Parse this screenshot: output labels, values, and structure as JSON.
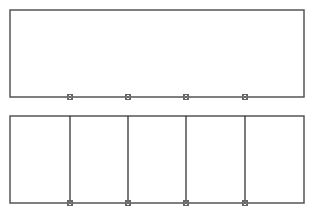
{
  "diagram": {
    "stroke_color": "#555555",
    "divider_color": "#222222",
    "marker_color": "#666666",
    "top_panel": {
      "rect": {
        "x": 10,
        "y": 10,
        "w": 294,
        "h": 87
      },
      "marker_xs": [
        70,
        128,
        186,
        245
      ],
      "dividers": false
    },
    "bottom_panel": {
      "rect": {
        "x": 10,
        "y": 116,
        "w": 294,
        "h": 87
      },
      "marker_xs": [
        70,
        128,
        186,
        245
      ],
      "dividers": true
    }
  }
}
